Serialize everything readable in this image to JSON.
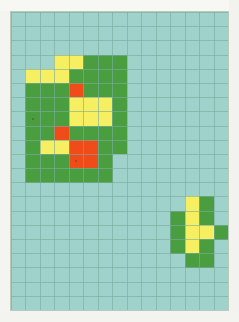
{
  "figure": {
    "width_px": 239,
    "height_px": 322
  },
  "palette": {
    "background": "#9ed2cb",
    "grid_line": "#7bab9f",
    "green": "#4a9e3f",
    "yellow": "#f5ef61",
    "red": "#ef4c1a",
    "paper": "#f5f5f2",
    "frame_border": "#b9c9bd"
  },
  "grid": {
    "columns": 15,
    "rows": 21,
    "cell_size_px": 14.6,
    "origin_x_px": 0,
    "origin_y_px": 0,
    "show_grid": true
  },
  "legend": {
    "green_label": "green",
    "yellow_label": "yellow",
    "red_label": "red",
    "background_label": "background"
  },
  "chart_data": {
    "type": "heatmap",
    "xlabel": "",
    "ylabel": "",
    "categories": [
      "0",
      "1",
      "2",
      "3",
      "4",
      "5",
      "6",
      "7",
      "8",
      "9",
      "10",
      "11",
      "12",
      "13",
      "14"
    ],
    "rows": 21,
    "columns": 15,
    "value_colors": {
      "0": "#9ed2cb",
      "1": "#4a9e3f",
      "2": "#f5ef61",
      "3": "#ef4c1a"
    },
    "value_labels": {
      "0": "background",
      "1": "green",
      "2": "yellow",
      "3": "red"
    },
    "matrix": [
      [
        0,
        0,
        0,
        0,
        0,
        0,
        0,
        0,
        0,
        0,
        0,
        0,
        0,
        0,
        0
      ],
      [
        0,
        0,
        0,
        0,
        0,
        0,
        0,
        0,
        0,
        0,
        0,
        0,
        0,
        0,
        0
      ],
      [
        0,
        0,
        0,
        0,
        0,
        0,
        0,
        0,
        0,
        0,
        0,
        0,
        0,
        0,
        0
      ],
      [
        0,
        0,
        0,
        2,
        2,
        1,
        1,
        1,
        0,
        0,
        0,
        0,
        0,
        0,
        0
      ],
      [
        0,
        2,
        2,
        2,
        1,
        1,
        1,
        1,
        0,
        0,
        0,
        0,
        0,
        0,
        0
      ],
      [
        0,
        1,
        1,
        1,
        3,
        1,
        1,
        1,
        0,
        0,
        0,
        0,
        0,
        0,
        0
      ],
      [
        0,
        1,
        1,
        1,
        2,
        2,
        2,
        1,
        0,
        0,
        0,
        0,
        0,
        0,
        0
      ],
      [
        0,
        1,
        1,
        1,
        2,
        2,
        2,
        1,
        0,
        0,
        0,
        0,
        0,
        0,
        0
      ],
      [
        0,
        1,
        1,
        3,
        1,
        1,
        1,
        1,
        0,
        0,
        0,
        0,
        0,
        0,
        0
      ],
      [
        0,
        1,
        2,
        2,
        3,
        3,
        1,
        1,
        0,
        0,
        0,
        0,
        0,
        0,
        0
      ],
      [
        0,
        1,
        1,
        1,
        3,
        3,
        1,
        0,
        0,
        0,
        0,
        0,
        0,
        0,
        0
      ],
      [
        0,
        1,
        1,
        1,
        1,
        1,
        1,
        0,
        0,
        0,
        0,
        0,
        0,
        0,
        0
      ],
      [
        0,
        0,
        0,
        0,
        0,
        0,
        0,
        0,
        0,
        0,
        0,
        0,
        0,
        0,
        0
      ],
      [
        0,
        0,
        0,
        0,
        0,
        0,
        0,
        0,
        0,
        0,
        0,
        0,
        2,
        1,
        0
      ],
      [
        0,
        0,
        0,
        0,
        0,
        0,
        0,
        0,
        0,
        0,
        0,
        1,
        2,
        1,
        0
      ],
      [
        0,
        0,
        0,
        0,
        0,
        0,
        0,
        0,
        0,
        0,
        0,
        1,
        2,
        2,
        1
      ],
      [
        0,
        0,
        0,
        0,
        0,
        0,
        0,
        0,
        0,
        0,
        0,
        1,
        2,
        1,
        0
      ],
      [
        0,
        0,
        0,
        0,
        0,
        0,
        0,
        0,
        0,
        0,
        0,
        0,
        1,
        1,
        0
      ],
      [
        0,
        0,
        0,
        0,
        0,
        0,
        0,
        0,
        0,
        0,
        0,
        0,
        0,
        0,
        0
      ],
      [
        0,
        0,
        0,
        0,
        0,
        0,
        0,
        0,
        0,
        0,
        0,
        0,
        0,
        0,
        0
      ],
      [
        0,
        0,
        0,
        0,
        0,
        0,
        0,
        0,
        0,
        0,
        0,
        0,
        0,
        0,
        0
      ]
    ],
    "clusters": [
      {
        "name": "upper-left-cluster",
        "cell_count": 60,
        "bounding_box": {
          "col_min": 1,
          "col_max": 7,
          "row_min": 3,
          "row_max": 11
        }
      },
      {
        "name": "lower-right-cluster",
        "cell_count": 15,
        "bounding_box": {
          "col_min": 11,
          "col_max": 14,
          "row_min": 13,
          "row_max": 17
        }
      }
    ],
    "specks": [
      {
        "col": 1,
        "row": 7
      },
      {
        "col": 4,
        "row": 10
      }
    ]
  }
}
